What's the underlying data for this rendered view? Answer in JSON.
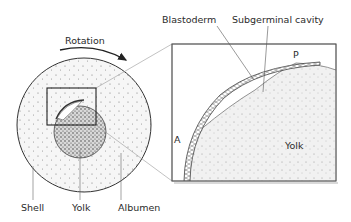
{
  "figure": {
    "labels": {
      "rotation": "Rotation",
      "shell": "Shell",
      "yolk_left": "Yolk",
      "albumen": "Albumen",
      "blastoderm": "Blastoderm",
      "subgerminal_cavity": "Subgerminal cavity",
      "point_p": "P",
      "point_a": "A",
      "yolk_right": "Yolk"
    },
    "colors": {
      "line": "#333333",
      "albumen_fill": "#f4f4f4",
      "yolk_fill": "#bdbdbd",
      "panel_fill": "#ffffff",
      "dot": "#777777"
    }
  }
}
